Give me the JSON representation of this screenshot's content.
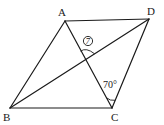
{
  "figure": {
    "type": "parallelogram-with-diagonals",
    "vertices": [
      {
        "name": "A",
        "label": "A",
        "x": 65,
        "y": 21,
        "lx": 58,
        "ly": 16
      },
      {
        "name": "D",
        "label": "D",
        "x": 149,
        "y": 19,
        "lx": 148,
        "ly": 15
      },
      {
        "name": "B",
        "label": "B",
        "x": 10,
        "y": 108,
        "lx": 3,
        "ly": 121
      },
      {
        "name": "C",
        "label": "C",
        "x": 112,
        "y": 108,
        "lx": 111,
        "ly": 121
      }
    ],
    "sides": [
      "AD",
      "DC",
      "CB",
      "BA"
    ],
    "diagonals": [
      "AC",
      "BD"
    ],
    "angles": [
      {
        "id": "angle-dca",
        "label": "70°",
        "at": "C",
        "between": [
          "D",
          "A"
        ],
        "lx": 103,
        "ly": 88
      },
      {
        "id": "angle-7",
        "label": "7",
        "at": "O",
        "between": [
          "A",
          "D"
        ],
        "marker": "circled",
        "lx": 88,
        "ly": 41
      }
    ],
    "stroke_color": "#1a1a1a",
    "background": "#ffffff"
  }
}
